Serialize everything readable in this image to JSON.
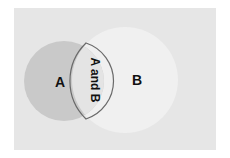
{
  "diagram": {
    "type": "venn",
    "sets": [
      {
        "label": "A",
        "color": "#c9c9c9"
      },
      {
        "label": "B",
        "color": "#f0f0f0"
      }
    ],
    "intersection": {
      "label": "A and B",
      "color": "#e4e4e4",
      "stroke": "#6a6a6a",
      "orientation": "vertical"
    },
    "background": "#e6e6e6"
  }
}
